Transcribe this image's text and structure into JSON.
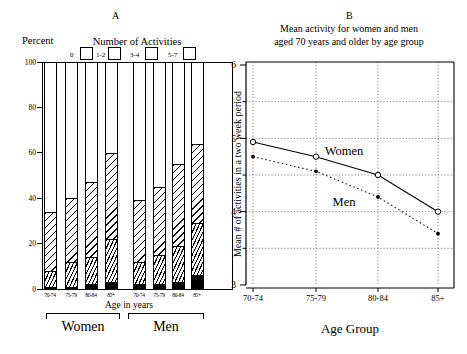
{
  "figure": {
    "panel_a": {
      "title": "A",
      "y_axis_title": "Percent",
      "legend_title": "Number of Activities",
      "legend": [
        {
          "label": "0",
          "pattern": "white"
        },
        {
          "label": "1-2",
          "pattern": "dense-hatch"
        },
        {
          "label": "3-4",
          "pattern": "wide-hatch"
        },
        {
          "label": "5-7",
          "pattern": "black"
        }
      ],
      "x_axis_title": "Age in years",
      "group_labels": [
        "Women",
        "Men"
      ],
      "y_ticks": [
        0,
        20,
        40,
        60,
        80,
        100
      ]
    },
    "panel_b": {
      "title": "B",
      "subtitle_line1": "Mean activity for women and men",
      "subtitle_line2": "aged 70 years and older by age group",
      "y_axis_title": "Mean # of activities in a two week period",
      "x_axis_title": "Age Group",
      "y_ticks": [
        3,
        4,
        5,
        6
      ]
    }
  },
  "chart_data": [
    {
      "type": "bar",
      "stacked": true,
      "title": "A",
      "ylabel": "Percent",
      "xlabel": "Age in years",
      "ylim": [
        0,
        100
      ],
      "groups": [
        "Women",
        "Men"
      ],
      "categories": [
        "70-74",
        "75-79",
        "80-84",
        "85+",
        "70-74",
        "75-79",
        "80-84",
        "85+"
      ],
      "series": [
        {
          "name": "5-7",
          "pattern": "black",
          "values": [
            1,
            1,
            2,
            3,
            2,
            2,
            3,
            6
          ]
        },
        {
          "name": "3-4",
          "pattern": "dense-hatch",
          "values": [
            7,
            11,
            12,
            19,
            10,
            13,
            16,
            23
          ]
        },
        {
          "name": "1-2",
          "pattern": "wide-hatch",
          "values": [
            26,
            28,
            33,
            38,
            27,
            30,
            36,
            35
          ]
        },
        {
          "name": "0",
          "pattern": "white",
          "values": [
            66,
            60,
            53,
            40,
            61,
            55,
            45,
            36
          ]
        }
      ]
    },
    {
      "type": "line",
      "title": "Mean activity for women and men aged 70 years and older by age group",
      "xlabel": "Age Group",
      "ylabel": "Mean # of activities in a two week period",
      "ylim": [
        3,
        6
      ],
      "grid": "dotted",
      "x": [
        "70-74",
        "75-79",
        "80-84",
        "85+"
      ],
      "series": [
        {
          "name": "Women",
          "marker": "open-circle",
          "line": "solid",
          "values": [
            4.95,
            4.75,
            4.5,
            4.0
          ]
        },
        {
          "name": "Men",
          "marker": "filled-circle",
          "line": "dotted",
          "values": [
            4.75,
            4.55,
            4.2,
            3.7
          ]
        }
      ]
    }
  ]
}
